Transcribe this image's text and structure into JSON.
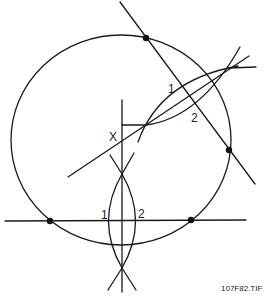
{
  "diagram": {
    "type": "geometric-construction",
    "labels": {
      "upper_arc_1": "1",
      "upper_arc_2": "2",
      "center_mark": "X",
      "lower_arc_1": "1",
      "lower_arc_2": "2"
    },
    "caption": "107F82.TIF",
    "colors": {
      "line": "#1a1a1a",
      "background": "#ffffff"
    }
  }
}
